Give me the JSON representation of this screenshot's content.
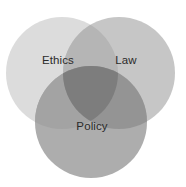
{
  "figure": {
    "name": "three-set-venn-diagram",
    "background_color": "#ffffff",
    "width": 186,
    "height": 187
  },
  "chart_data": {
    "type": "venn",
    "title": "",
    "subtitle": "",
    "xlabel": "",
    "ylabel": "",
    "grid": false,
    "legend": "none",
    "set_count": 3,
    "sets": [
      {
        "id": "ethics",
        "label": "Ethics",
        "fill_color": "#dcdcdc",
        "label_color": "#2b2b2b",
        "cx": 62,
        "cy": 73,
        "r": 56,
        "label_x": 58,
        "label_y": 61
      },
      {
        "id": "law",
        "label": "Law",
        "fill_color": "#c6c6c6",
        "label_color": "#2b2b2b",
        "cx": 119,
        "cy": 73,
        "r": 56,
        "label_x": 126,
        "label_y": 61
      },
      {
        "id": "policy",
        "label": "Policy",
        "fill_color": "#adadad",
        "label_color": "#2b2b2b",
        "cx": 91,
        "cy": 122,
        "r": 56,
        "label_x": 92,
        "label_y": 127
      }
    ],
    "intersections": [
      {
        "id": "ethics-law",
        "sets": [
          "ethics",
          "law"
        ],
        "fill_color": "#b5b5b5"
      },
      {
        "id": "ethics-policy",
        "sets": [
          "ethics",
          "policy"
        ],
        "fill_color": "#a3a3a3"
      },
      {
        "id": "law-policy",
        "sets": [
          "law",
          "policy"
        ],
        "fill_color": "#949494"
      },
      {
        "id": "ethics-law-policy",
        "sets": [
          "ethics",
          "law",
          "policy"
        ],
        "fill_color": "#7d7d7d"
      }
    ]
  }
}
